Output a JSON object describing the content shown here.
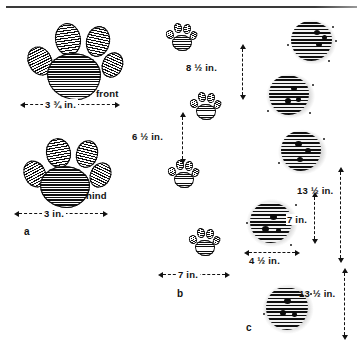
{
  "figure": {
    "kind": "animal-track-identification-plate",
    "panels": [
      {
        "id": "a",
        "id_label": "a",
        "subject": "individual paw prints",
        "tracks": [
          {
            "name": "front-paw-print",
            "label": "front",
            "width_label": "3 ¾ in."
          },
          {
            "name": "hind-paw-print",
            "label": "hind",
            "width_label": "3 in."
          }
        ]
      },
      {
        "id": "b",
        "id_label": "b",
        "subject": "trail pattern / stride measurements",
        "measurements": [
          {
            "name": "stride-upper",
            "label": "8 ½ in.",
            "orientation": "vertical"
          },
          {
            "name": "stride-lower",
            "label": "6 ½ in.",
            "orientation": "vertical"
          },
          {
            "name": "straddle",
            "label": "7 in.",
            "orientation": "horizontal"
          }
        ]
      },
      {
        "id": "c",
        "id_label": "c",
        "subject": "indistinct tracks in snow",
        "measurements": [
          {
            "name": "stride-upper",
            "label": "13 ½ in.",
            "orientation": "vertical"
          },
          {
            "name": "group-spacing",
            "label": "7 in.",
            "orientation": "vertical"
          },
          {
            "name": "track-width",
            "label": "4 ½ in.",
            "orientation": "horizontal"
          },
          {
            "name": "stride-lower",
            "label": "13 ½ in.",
            "orientation": "vertical"
          }
        ]
      }
    ]
  },
  "labels": {
    "front": "front",
    "hind": "hind",
    "width_front": "3 ¾ in.",
    "width_hind": "3 in.",
    "stride_b_upper": "8 ½ in.",
    "stride_b_lower": "6 ½ in.",
    "straddle_b": "7 in.",
    "stride_c_upper": "13 ½ in.",
    "gap_c": "7 in.",
    "width_c": "4 ½ in.",
    "stride_c_lower": "13 ½ in.",
    "panel_a": "a",
    "panel_b": "b",
    "panel_c": "c"
  },
  "colors": {
    "ink": "#111111",
    "paper": "#ffffff",
    "hatch": "#0d0d0d"
  }
}
